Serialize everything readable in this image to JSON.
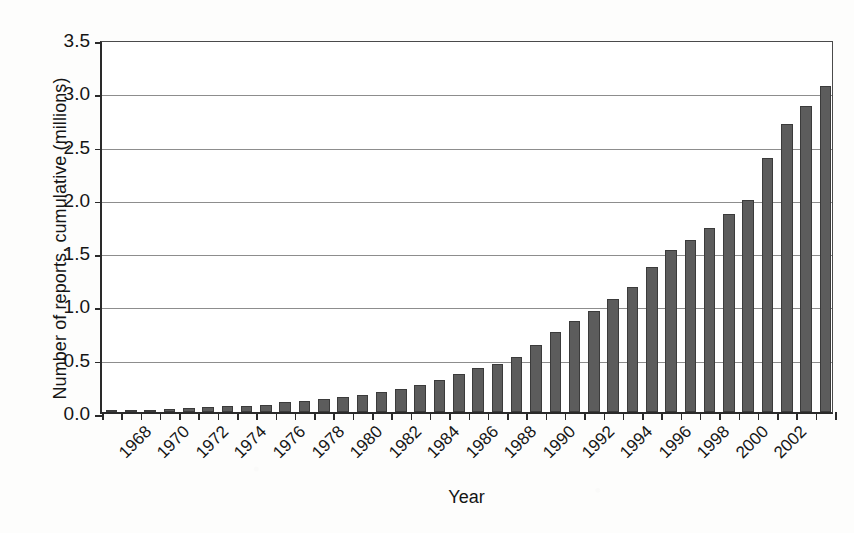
{
  "chart_data": {
    "type": "bar",
    "title": "",
    "xlabel": "Year",
    "ylabel": "Number of reports, cumulative (millions)",
    "ylim": [
      0.0,
      3.5
    ],
    "yticks": [
      "0.0",
      "0.5",
      "1.0",
      "1.5",
      "2.0",
      "2.5",
      "3.0",
      "3.5"
    ],
    "ytick_values": [
      0.0,
      0.5,
      1.0,
      1.5,
      2.0,
      2.5,
      3.0,
      3.5
    ],
    "grid": "horizontal",
    "legend": "none",
    "bar_color": "#5c5c5c",
    "bar_edge_color": "#3b3b3b",
    "xtick_labels": [
      "1968",
      "1970",
      "1972",
      "1974",
      "1976",
      "1978",
      "1980",
      "1982",
      "1984",
      "1986",
      "1988",
      "1990",
      "1992",
      "1994",
      "1996",
      "1998",
      "2000",
      "2002"
    ],
    "xtick_label_rotation": -45,
    "categories": [
      "1968",
      "1969",
      "1970",
      "1971",
      "1972",
      "1973",
      "1974",
      "1975",
      "1976",
      "1977",
      "1978",
      "1979",
      "1980",
      "1981",
      "1982",
      "1983",
      "1984",
      "1985",
      "1986",
      "1987",
      "1988",
      "1989",
      "1990",
      "1991",
      "1992",
      "1993",
      "1994",
      "1995",
      "1996",
      "1997",
      "1998",
      "1999",
      "2000",
      "2001",
      "2002",
      "2003"
    ],
    "values": [
      0.01,
      0.02,
      0.02,
      0.03,
      0.04,
      0.05,
      0.06,
      0.06,
      0.07,
      0.09,
      0.1,
      0.12,
      0.14,
      0.16,
      0.19,
      0.22,
      0.25,
      0.3,
      0.36,
      0.41,
      0.45,
      0.52,
      0.63,
      0.75,
      0.85,
      0.95,
      1.06,
      1.17,
      1.36,
      1.52,
      1.61,
      1.73,
      1.86,
      1.99,
      2.38,
      2.7
    ],
    "values_tail": [
      2.87,
      3.06
    ],
    "units": "millions of reports (cumulative)"
  },
  "axis": {
    "y_axis_name": "y-axis",
    "x_axis_name": "x-axis"
  }
}
